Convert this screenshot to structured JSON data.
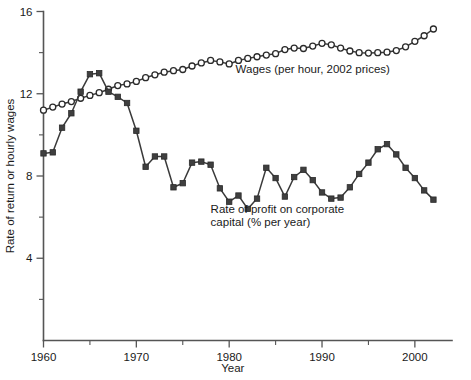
{
  "chart_data": {
    "type": "line",
    "title": "",
    "xlabel": "Year",
    "ylabel": "Rate of return or hourly wages",
    "xlim": [
      1960,
      2004
    ],
    "ylim": [
      0,
      16
    ],
    "grid": false,
    "legend_position": "inline-annotation",
    "x_ticks_major": [
      1960,
      1970,
      1980,
      1990,
      2000
    ],
    "x_ticks_minor": [
      1965,
      1975,
      1985,
      1995
    ],
    "y_ticks_major": [
      4,
      8,
      12,
      16
    ],
    "y_ticks_minor": [
      2,
      6,
      10,
      14
    ],
    "annotations": [
      {
        "name": "wages-annotation",
        "text": "Wages (per hour, 2002 prices)",
        "x": 1989,
        "y": 13.0
      },
      {
        "name": "profit-annotation-line1",
        "text": "Rate of profit on corporate",
        "x": 1978,
        "y": 6.2
      },
      {
        "name": "profit-annotation-line2",
        "text": "capital (% per year)",
        "x": 1978,
        "y": 5.55
      }
    ],
    "series": [
      {
        "name": "Wages (per hour, 2002 prices)",
        "marker": "open-circle",
        "color": "#2a2a2a",
        "x": [
          1960,
          1961,
          1962,
          1963,
          1964,
          1965,
          1966,
          1967,
          1968,
          1969,
          1970,
          1971,
          1972,
          1973,
          1974,
          1975,
          1976,
          1977,
          1978,
          1979,
          1980,
          1981,
          1982,
          1983,
          1984,
          1985,
          1986,
          1987,
          1988,
          1989,
          1990,
          1991,
          1992,
          1993,
          1994,
          1995,
          1996,
          1997,
          1998,
          1999,
          2000,
          2001,
          2002
        ],
        "values": [
          11.2,
          11.35,
          11.5,
          11.62,
          11.78,
          11.92,
          12.05,
          12.22,
          12.4,
          12.48,
          12.6,
          12.78,
          12.92,
          13.05,
          13.12,
          13.18,
          13.35,
          13.5,
          13.62,
          13.55,
          13.45,
          13.62,
          13.72,
          13.8,
          13.88,
          13.95,
          14.15,
          14.22,
          14.2,
          14.32,
          14.45,
          14.38,
          14.22,
          14.08,
          14.0,
          13.98,
          14.0,
          14.02,
          14.1,
          14.28,
          14.55,
          14.82,
          15.15
        ]
      },
      {
        "name": "Rate of profit on corporate capital (% per year)",
        "marker": "filled-square",
        "color": "#3f3f3f",
        "x": [
          1960,
          1961,
          1962,
          1963,
          1964,
          1965,
          1966,
          1967,
          1968,
          1969,
          1970,
          1971,
          1972,
          1973,
          1974,
          1975,
          1976,
          1977,
          1978,
          1979,
          1980,
          1981,
          1982,
          1983,
          1984,
          1985,
          1986,
          1987,
          1988,
          1989,
          1990,
          1991,
          1992,
          1993,
          1994,
          1995,
          1996,
          1997,
          1998,
          1999,
          2000,
          2001,
          2002
        ],
        "values": [
          9.1,
          9.15,
          10.35,
          11.05,
          12.1,
          12.95,
          13.0,
          12.1,
          11.85,
          11.55,
          10.2,
          8.45,
          8.95,
          8.95,
          7.45,
          7.65,
          8.65,
          8.7,
          8.55,
          7.4,
          6.75,
          7.05,
          6.4,
          6.9,
          8.4,
          7.9,
          7.0,
          7.95,
          8.3,
          7.8,
          7.2,
          6.9,
          6.95,
          7.45,
          8.1,
          8.65,
          9.3,
          9.55,
          9.05,
          8.4,
          7.9,
          7.3,
          6.85
        ]
      }
    ]
  }
}
